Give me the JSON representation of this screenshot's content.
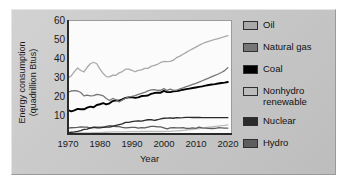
{
  "chart_data": {
    "type": "line",
    "title": "",
    "xlabel": "Year",
    "ylabel": "Energy consumption\n(quadrillion Btus)",
    "ylabel_line1": "Energy consumption",
    "ylabel_line2": "(quadrillion Btus)",
    "xlim": [
      1970,
      2021
    ],
    "ylim": [
      0,
      60
    ],
    "yticks": [
      10,
      20,
      30,
      40,
      50,
      60
    ],
    "xticks": [
      1970,
      1980,
      1990,
      2000,
      2010,
      2020
    ],
    "grid": false,
    "legend_position": "right",
    "colors": {
      "oil": "#a9a9a9",
      "natural_gas": "#767676",
      "coal": "#000000",
      "nonhydro_renewable": "#bcbcbc",
      "nuclear": "#2b2b2b",
      "hydro": "#5e5e5e"
    },
    "x": [
      1970,
      1971,
      1972,
      1973,
      1974,
      1975,
      1976,
      1977,
      1978,
      1979,
      1980,
      1981,
      1982,
      1983,
      1984,
      1985,
      1986,
      1987,
      1988,
      1989,
      1990,
      1991,
      1992,
      1993,
      1994,
      1995,
      1996,
      1997,
      1998,
      1999,
      2000,
      2001,
      2002,
      2003,
      2004,
      2005,
      2006,
      2007,
      2008,
      2009,
      2010,
      2011,
      2012,
      2013,
      2014,
      2015,
      2016,
      2017,
      2018,
      2019,
      2020
    ],
    "series": [
      {
        "name": "Oil",
        "color": "#a9a9a9",
        "values": [
          29.5,
          30.6,
          32.9,
          34.8,
          33.5,
          32.7,
          35.2,
          37.1,
          37.9,
          37.1,
          34.2,
          31.9,
          30.2,
          30.1,
          31.0,
          30.9,
          32.2,
          32.9,
          34.2,
          34.2,
          33.6,
          32.8,
          33.5,
          33.8,
          34.6,
          34.6,
          35.7,
          36.2,
          36.8,
          37.8,
          38.3,
          38.2,
          38.4,
          39.0,
          40.4,
          41.2,
          42.2,
          43.2,
          44.2,
          45.1,
          46.0,
          46.9,
          47.8,
          48.5,
          49.1,
          49.6,
          50.1,
          50.6,
          51.1,
          51.6,
          52.2
        ]
      },
      {
        "name": "Natural gas",
        "color": "#767676",
        "values": [
          21.8,
          22.5,
          22.7,
          22.5,
          21.7,
          19.9,
          20.3,
          19.9,
          20.0,
          20.7,
          20.4,
          19.9,
          18.5,
          17.4,
          18.5,
          17.8,
          16.7,
          17.7,
          18.6,
          19.4,
          19.6,
          20.0,
          20.7,
          21.2,
          21.7,
          22.6,
          23.1,
          23.2,
          22.8,
          22.9,
          23.8,
          22.8,
          23.5,
          22.8,
          22.9,
          23.6,
          24.2,
          24.8,
          25.4,
          26.0,
          26.6,
          27.3,
          28.0,
          28.7,
          29.4,
          30.2,
          30.9,
          31.6,
          32.4,
          33.4,
          35.0
        ]
      },
      {
        "name": "Coal",
        "color": "#000000",
        "values": [
          12.3,
          11.6,
          12.1,
          12.9,
          12.7,
          12.7,
          13.6,
          14.1,
          13.8,
          15.0,
          15.4,
          16.0,
          15.3,
          15.9,
          17.1,
          17.5,
          17.3,
          18.0,
          18.8,
          19.1,
          19.2,
          18.8,
          19.1,
          19.8,
          19.9,
          20.1,
          21.0,
          21.4,
          21.6,
          21.6,
          22.6,
          21.9,
          21.9,
          22.3,
          22.5,
          22.8,
          23.2,
          23.5,
          23.8,
          24.1,
          24.4,
          24.7,
          25.0,
          25.4,
          25.7,
          26.0,
          26.2,
          26.5,
          26.8,
          27.0,
          27.3
        ]
      },
      {
        "name": "Nuclear",
        "color": "#2b2b2b",
        "values": [
          0.2,
          0.4,
          0.6,
          0.9,
          1.3,
          1.9,
          2.1,
          2.7,
          3.0,
          2.8,
          2.7,
          3.0,
          3.1,
          3.2,
          3.6,
          4.1,
          4.5,
          4.9,
          5.7,
          5.7,
          6.1,
          6.4,
          6.5,
          6.4,
          6.8,
          7.1,
          7.2,
          6.7,
          7.1,
          7.6,
          7.9,
          8.0,
          8.1,
          7.9,
          8.2,
          8.1,
          8.2,
          8.4,
          8.4,
          8.3,
          8.4,
          8.3,
          8.2,
          8.2,
          8.2,
          8.2,
          8.2,
          8.2,
          8.2,
          8.2,
          8.2
        ]
      },
      {
        "name": "Hydro",
        "color": "#5e5e5e",
        "values": [
          2.6,
          2.8,
          2.9,
          3.0,
          3.3,
          3.2,
          3.1,
          2.5,
          3.1,
          3.1,
          3.1,
          3.1,
          3.6,
          3.9,
          3.8,
          3.4,
          3.4,
          3.0,
          2.7,
          2.9,
          3.0,
          3.0,
          2.6,
          2.9,
          2.7,
          3.2,
          3.6,
          3.6,
          3.3,
          3.3,
          2.8,
          2.2,
          2.7,
          2.8,
          2.7,
          2.7,
          2.9,
          2.5,
          2.5,
          2.7,
          2.5,
          3.1,
          2.7,
          2.6,
          2.5,
          2.4,
          2.5,
          2.8,
          2.7,
          2.6,
          2.6
        ]
      },
      {
        "name": "Nonhydro renewable",
        "color": "#bcbcbc",
        "values": [
          0.1,
          0.1,
          0.1,
          0.1,
          0.1,
          0.1,
          0.1,
          0.1,
          0.2,
          0.2,
          0.2,
          0.3,
          0.4,
          0.5,
          0.6,
          0.6,
          0.6,
          0.6,
          0.6,
          0.7,
          0.7,
          0.7,
          0.7,
          0.8,
          0.8,
          0.8,
          0.8,
          0.8,
          0.8,
          0.8,
          0.8,
          0.9,
          0.9,
          1.0,
          1.1,
          1.2,
          1.4,
          1.6,
          1.8,
          2.0,
          2.2,
          2.4,
          2.6,
          2.9,
          3.1,
          3.3,
          3.5,
          3.7,
          3.9,
          4.1,
          4.4
        ]
      }
    ]
  },
  "axis": {
    "ylabel_line1": "Energy consumption",
    "ylabel_line2": "(quadrillion Btus)",
    "xlabel": "Year",
    "yticks": [
      "60",
      "50",
      "40",
      "30",
      "20",
      "10"
    ],
    "xticks": [
      "1970",
      "1980",
      "1990",
      "2000",
      "2010",
      "2020"
    ]
  },
  "legend": {
    "items": [
      {
        "label": "Oil",
        "color": "#a9a9a9"
      },
      {
        "label": "Natural gas",
        "color": "#767676"
      },
      {
        "label": "Coal",
        "color": "#000000"
      },
      {
        "label": "Nonhydro\nrenewable",
        "color": "#bcbcbc"
      },
      {
        "label": "Nuclear",
        "color": "#2b2b2b"
      },
      {
        "label": "Hydro",
        "color": "#5e5e5e"
      }
    ]
  }
}
